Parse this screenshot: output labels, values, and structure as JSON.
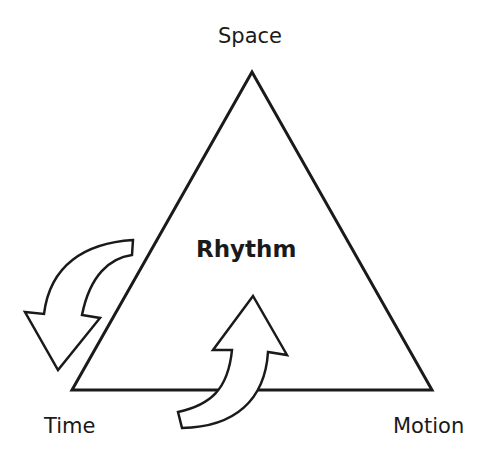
{
  "diagram": {
    "shape": "triangle",
    "center_label": "Rhythm",
    "vertices": {
      "top": "Space",
      "bottom_left": "Time",
      "bottom_right": "Motion"
    },
    "arrows": [
      {
        "name": "curved-arrow-left",
        "direction": "down-left",
        "near": "Time"
      },
      {
        "name": "curved-arrow-bottom",
        "direction": "up",
        "near": "bottom edge"
      }
    ],
    "colors": {
      "stroke": "#1a1a1a",
      "fill": "#ffffff",
      "text": "#1a1a1a"
    }
  }
}
